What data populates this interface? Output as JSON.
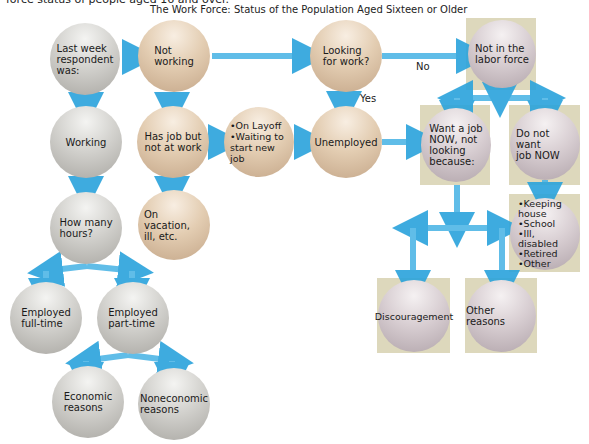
{
  "caption": "force status of people aged 16 and over.",
  "title": "The Work Force: Status of the Population Aged Sixteen or Older",
  "colors": {
    "arrow": "#2aa3dc",
    "gray_node": "#c8c7c3",
    "tan_node": "#dcc4a6",
    "mauve_node": "#d4cace",
    "box": "#ddd8bc"
  },
  "nodes": {
    "last_week": "Last week\nrespondent\nwas:",
    "not_working": "Not\nworking",
    "looking": "Looking\nfor work?",
    "not_in_labor": "Not in the\nlabor force",
    "working": "Working",
    "has_job": "Has job but\nnot at work",
    "layoff": "•On Layoff\n•Waiting to\nstart new job",
    "unemployed": "Unemployed",
    "want_job": "Want a job\nNOW, not\nlooking\nbecause:",
    "not_want_job": "Do not want\njob NOW",
    "how_many_hours": "How many\nhours?",
    "vacation": "On vacation,\nill, etc.",
    "reasons_list": "•Keeping\n  house\n•School\n•Ill, disabled\n•Retired\n•Other",
    "full_time": "Employed\nfull-time",
    "part_time": "Employed\npart-time",
    "discouragement": "Discouragement",
    "other_reasons": "Other reasons",
    "economic": "Economic\nreasons",
    "noneconomic": "Noneconomic\nreasons"
  },
  "edge_labels": {
    "yes": "Yes",
    "no": "No"
  }
}
